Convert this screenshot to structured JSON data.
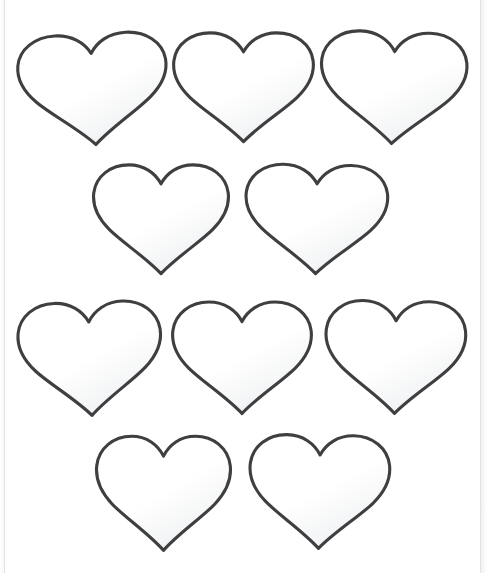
{
  "document": {
    "type": "printable-worksheet",
    "title": "HEART TEMPLATES",
    "title_visible_state": "clipped-at-top",
    "paper_color": "#ffffff",
    "outline_color": "#3f3f42",
    "shade_color": "#e9eaec",
    "total_shapes": 10,
    "shape_name": "heart-outline"
  },
  "rows": [
    {
      "row_label": "row-1",
      "count": 3,
      "hearts": [
        {
          "label": "heart-1",
          "x": 16,
          "y": 25,
          "w": 154,
          "h": 126,
          "rotate": -3
        },
        {
          "label": "heart-2",
          "x": 171,
          "y": 24,
          "w": 145,
          "h": 124,
          "rotate": 0
        },
        {
          "label": "heart-3",
          "x": 318,
          "y": 23,
          "w": 151,
          "h": 127,
          "rotate": 2
        }
      ]
    },
    {
      "row_label": "row-2",
      "count": 2,
      "hearts": [
        {
          "label": "heart-4",
          "x": 91,
          "y": 156,
          "w": 140,
          "h": 124,
          "rotate": 0
        },
        {
          "label": "heart-5",
          "x": 243,
          "y": 156,
          "w": 147,
          "h": 124,
          "rotate": 1
        }
      ]
    },
    {
      "row_label": "row-3",
      "count": 3,
      "hearts": [
        {
          "label": "heart-6",
          "x": 16,
          "y": 293,
          "w": 148,
          "h": 129,
          "rotate": -2
        },
        {
          "label": "heart-7",
          "x": 170,
          "y": 293,
          "w": 144,
          "h": 127,
          "rotate": 0
        },
        {
          "label": "heart-8",
          "x": 323,
          "y": 292,
          "w": 145,
          "h": 128,
          "rotate": 1
        }
      ]
    },
    {
      "row_label": "row-4",
      "count": 2,
      "hearts": [
        {
          "label": "heart-9",
          "x": 94,
          "y": 427,
          "w": 139,
          "h": 130,
          "rotate": 0
        },
        {
          "label": "heart-10",
          "x": 247,
          "y": 426,
          "w": 145,
          "h": 129,
          "rotate": 1
        }
      ]
    }
  ]
}
